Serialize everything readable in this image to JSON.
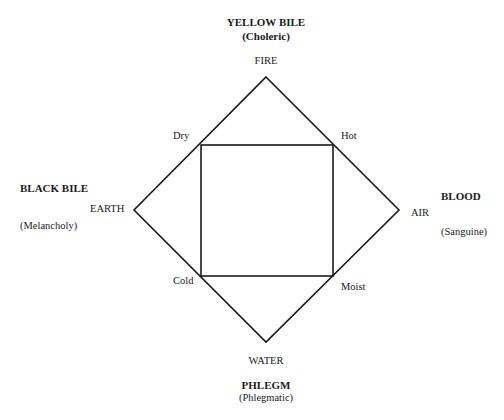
{
  "diagram": {
    "type": "four-humours",
    "shapes": {
      "diamond": [
        [
          266,
          77
        ],
        [
          399,
          210
        ],
        [
          266,
          342
        ],
        [
          134,
          210
        ]
      ],
      "square": {
        "x1": 201,
        "y1": 145,
        "x2": 333,
        "y2": 276
      },
      "stroke_color": "#1a1a1a"
    },
    "humours": {
      "top": {
        "name": "YELLOW BILE",
        "temperament": "(Choleric)"
      },
      "left": {
        "name": "BLACK BILE",
        "temperament": "(Melancholy)"
      },
      "right": {
        "name": "BLOOD",
        "temperament": "(Sanguine)"
      },
      "bottom": {
        "name": "PHLEGM",
        "temperament": "(Phlegmatic)"
      }
    },
    "elements": {
      "top": "FIRE",
      "left": "EARTH",
      "right": "AIR",
      "bottom": "WATER"
    },
    "qualities": {
      "top_left": "Dry",
      "top_right": "Hot",
      "bottom_left": "Cold",
      "bottom_right": "Moist"
    }
  }
}
